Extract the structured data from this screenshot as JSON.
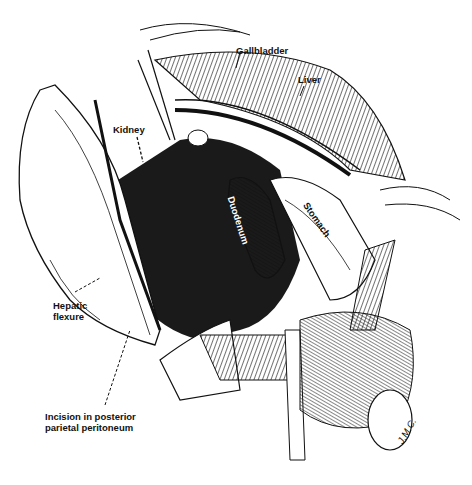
{
  "figure": {
    "signature": "J.M.C.",
    "caption_visible": false
  },
  "labels": {
    "gallbladder": "Gallbladder",
    "liver": "Liver",
    "kidney": "Kidney",
    "duodenum": "Duodenum",
    "stomach": "Stomach",
    "hepatic_flexure_line1": "Hepatic",
    "hepatic_flexure_line2": "flexure",
    "incision_line1": "Incision in posterior",
    "incision_line2": "parietal peritoneum"
  },
  "colors": {
    "ink": "#111111",
    "paper": "#ffffff",
    "shade": "#2a2a2a"
  }
}
